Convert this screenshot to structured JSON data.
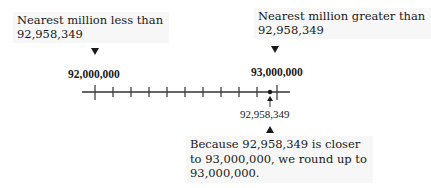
{
  "left_callout": {
    "line1": "Nearest million less than",
    "line2": "92,958,349"
  },
  "right_callout": {
    "line1": "Nearest million greater than",
    "line2": "92,958,349"
  },
  "number_line": {
    "start_label": "92,000,000",
    "end_label": "93,000,000",
    "point_label": "92,958,349",
    "start_value": 92000000,
    "end_value": 93000000,
    "point_value": 92958349,
    "tick_count": 11
  },
  "explanation": {
    "line1": "Because 92,958,349 is closer",
    "line2": "to 93,000,000, we round up to",
    "line3": "93,000,000."
  }
}
